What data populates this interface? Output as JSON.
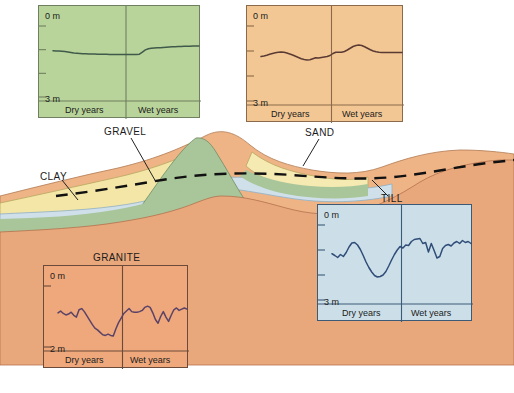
{
  "figure": {
    "background_color": "#ffffff"
  },
  "cross_section": {
    "labels": [
      {
        "name": "gravel",
        "text": "GRAVEL"
      },
      {
        "name": "clay",
        "text": "CLAY"
      },
      {
        "name": "sand",
        "text": "SAND"
      },
      {
        "name": "till",
        "text": "TILL"
      },
      {
        "name": "granite",
        "text": "GRANITE"
      }
    ],
    "colors": {
      "gravel": "#e9b183",
      "clay": "#f2e6a8",
      "sand": "#f5e8b0",
      "till": "#cfe0ea",
      "granite": "#e8a87c",
      "hill": "#a8c49a",
      "sky": "#ffffff",
      "water_table_line": "#101010",
      "base_band": "#f7ded0"
    },
    "water_table_style": "dashed"
  },
  "panels": [
    {
      "name": "gravel-panel",
      "material": "GRAVEL",
      "fill_color": "#b9d49a",
      "border_color": "#6f7f5f",
      "line_color": "#3f5a4a",
      "axis_top_label": "0 m",
      "axis_bottom_label": "3 m",
      "left_period_label": "Dry years",
      "right_period_label": "Wet years",
      "chart_data": {
        "type": "line",
        "title": "GRAVEL",
        "xlabel": "",
        "ylabel": "Depth to water table (m)",
        "ylim": [
          3,
          0
        ],
        "ytick_values": [
          0,
          1,
          2,
          3
        ],
        "ytick_labels": [
          "0 m",
          "",
          "",
          "3 m"
        ],
        "x_divider_fraction": 0.5,
        "x_regions": [
          "Dry years",
          "Wet years"
        ],
        "values": [
          1.05,
          1.06,
          1.06,
          1.07,
          1.08,
          1.1,
          1.12,
          1.14,
          1.15,
          1.16,
          1.17,
          1.17,
          1.18,
          1.18,
          1.18,
          1.19,
          1.19,
          1.19,
          1.19,
          1.2,
          1.2,
          1.2,
          1.2,
          1.2,
          1.2,
          1.2,
          1.2,
          1.2,
          1.2,
          1.19,
          1.1,
          1.01,
          0.96,
          0.94,
          0.93,
          0.92,
          0.92,
          0.91,
          0.9,
          0.89,
          0.88,
          0.88,
          0.87,
          0.87,
          0.86,
          0.86,
          0.86,
          0.85,
          0.85,
          0.85
        ]
      }
    },
    {
      "name": "sand-panel",
      "material": "SAND",
      "fill_color": "#f2c794",
      "border_color": "#8a6a4a",
      "line_color": "#5a3a33",
      "axis_top_label": "0 m",
      "axis_bottom_label": "3 m",
      "left_period_label": "Dry years",
      "right_period_label": "Wet years",
      "chart_data": {
        "type": "line",
        "title": "SAND",
        "xlabel": "",
        "ylabel": "Depth to water table (m)",
        "ylim": [
          3,
          0
        ],
        "ytick_values": [
          0,
          1,
          2,
          3
        ],
        "ytick_labels": [
          "0 m",
          "",
          "",
          "3 m"
        ],
        "x_divider_fraction": 0.5,
        "x_regions": [
          "Dry years",
          "Wet years"
        ],
        "values": [
          1.22,
          1.2,
          1.17,
          1.13,
          1.1,
          1.07,
          1.05,
          1.04,
          1.05,
          1.08,
          1.12,
          1.16,
          1.21,
          1.26,
          1.31,
          1.34,
          1.36,
          1.35,
          1.31,
          1.27,
          1.28,
          1.26,
          1.24,
          1.22,
          1.18,
          1.1,
          1.05,
          1.05,
          1.05,
          1.02,
          0.96,
          0.89,
          0.82,
          0.78,
          0.76,
          0.78,
          0.83,
          0.89,
          0.95,
          1.0,
          1.03,
          1.05,
          1.06,
          1.06,
          1.06,
          1.06,
          1.06,
          1.06,
          1.06,
          1.06
        ]
      }
    },
    {
      "name": "granite-panel",
      "material": "GRANITE",
      "fill_color": "#eea87b",
      "border_color": "#6b4a3a",
      "line_color": "#5b4368",
      "axis_top_label": "0 m",
      "axis_bottom_label": "2 m",
      "left_period_label": "Dry years",
      "right_period_label": "Wet years",
      "chart_data": {
        "type": "line",
        "title": "GRANITE",
        "xlabel": "",
        "ylabel": "Depth to water table (m)",
        "ylim": [
          2,
          0
        ],
        "ytick_values": [
          0,
          2
        ],
        "ytick_labels": [
          "0 m",
          "2 m"
        ],
        "x_divider_fraction": 0.5,
        "x_regions": [
          "Dry years",
          "Wet years"
        ],
        "values": [
          0.88,
          0.82,
          0.9,
          0.95,
          0.92,
          0.86,
          0.96,
          1.02,
          0.78,
          0.74,
          0.84,
          0.98,
          1.12,
          1.26,
          1.38,
          1.44,
          1.52,
          1.6,
          1.62,
          1.58,
          1.62,
          1.64,
          1.4,
          1.2,
          1.05,
          0.9,
          0.82,
          0.74,
          0.84,
          0.86,
          0.86,
          0.84,
          0.8,
          0.7,
          0.66,
          0.7,
          0.88,
          1.1,
          1.22,
          1.0,
          0.84,
          1.02,
          1.16,
          0.96,
          0.78,
          0.72,
          0.8,
          0.76,
          0.72,
          0.76
        ]
      }
    },
    {
      "name": "till-panel",
      "material": "TILL",
      "fill_color": "#ccdfe9",
      "border_color": "#3a5a78",
      "line_color": "#2f4d78",
      "axis_top_label": "0 m",
      "axis_bottom_label": "3 m",
      "left_period_label": "Dry years",
      "right_period_label": "Wet years",
      "chart_data": {
        "type": "line",
        "title": "TILL",
        "xlabel": "",
        "ylabel": "Depth to water table (m)",
        "ylim": [
          3,
          0
        ],
        "ytick_values": [
          0,
          1,
          2,
          3
        ],
        "ytick_labels": [
          "0 m",
          "",
          "",
          "3 m"
        ],
        "x_divider_fraction": 0.5,
        "x_regions": [
          "Dry years",
          "Wet years"
        ],
        "values": [
          1.15,
          1.22,
          1.3,
          1.18,
          1.26,
          1.1,
          0.88,
          0.72,
          0.7,
          0.8,
          0.98,
          1.22,
          1.48,
          1.7,
          1.88,
          2.02,
          2.08,
          2.06,
          2.0,
          1.86,
          1.64,
          1.4,
          1.18,
          1.0,
          0.86,
          0.92,
          0.8,
          0.82,
          0.66,
          0.58,
          0.56,
          0.54,
          0.74,
          0.7,
          1.08,
          0.74,
          1.02,
          1.32,
          1.26,
          0.94,
          0.82,
          0.78,
          0.84,
          0.72,
          0.66,
          0.74,
          0.62,
          0.7,
          0.66,
          0.74
        ]
      }
    }
  ]
}
